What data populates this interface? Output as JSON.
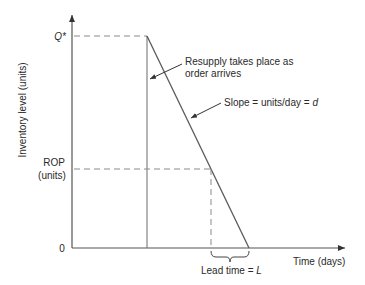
{
  "diagram": {
    "type": "inventory-reorder-point",
    "y_axis_label": "Inventory level (units)",
    "x_axis_label": "Time (days)",
    "y_ticks": {
      "q_star": "Q*",
      "rop_line1": "ROP",
      "rop_line2": "(units)",
      "zero": "0"
    },
    "annotations": {
      "resupply_line1": "Resupply takes place as",
      "resupply_line2": "order arrives",
      "slope_prefix": "Slope = units/day = ",
      "slope_var": "d",
      "lead_time_prefix": "Lead time = ",
      "lead_time_var": "L"
    },
    "colors": {
      "axis": "#555555",
      "line": "#5a5a5a",
      "dashed": "#8a8a8a",
      "text": "#2a2a2a"
    }
  }
}
